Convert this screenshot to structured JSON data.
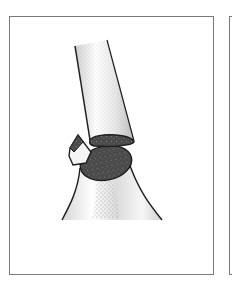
{
  "figure": {
    "panels": [
      {
        "id": "main",
        "description": "fractured long bone with displaced fragment"
      },
      {
        "id": "next",
        "description": "adjacent panel, partially visible"
      }
    ]
  },
  "colors": {
    "frame": "#7a7a7a",
    "outline": "#1e1e1e",
    "cut_surface": "#4a4a4a",
    "bone_fill": "#f2f2f2",
    "stipple": "#8c8c8c",
    "background": "#ffffff"
  }
}
